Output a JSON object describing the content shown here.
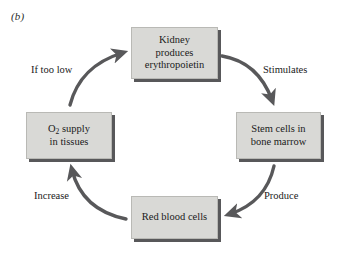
{
  "figure": {
    "panel_label": "(b)",
    "accent_color": "#58585a",
    "box_fill": "#d9d9d6",
    "arrow_color": "#58585a",
    "text_color": "#1a1a1a"
  },
  "nodes": [
    {
      "id": "kidney",
      "text": "Kidney\nproduces\nerythropoietin",
      "position": "top"
    },
    {
      "id": "stem-cells",
      "text": "Stem cells in\nbone marrow",
      "position": "right"
    },
    {
      "id": "red-blood-cells",
      "text": "Red blood cells",
      "position": "bottom"
    },
    {
      "id": "oxygen-supply",
      "text_before_sub": "O",
      "sub": "2",
      "text_after_sub": " supply\nin tissues",
      "position": "left"
    }
  ],
  "edges": [
    {
      "id": "stimulates",
      "label": "Stimulates",
      "from": "kidney",
      "to": "stem-cells"
    },
    {
      "id": "produce",
      "label": "Produce",
      "from": "stem-cells",
      "to": "red-blood-cells"
    },
    {
      "id": "increase",
      "label": "Increase",
      "from": "red-blood-cells",
      "to": "oxygen-supply"
    },
    {
      "id": "if-too-low",
      "label": "If too low",
      "from": "oxygen-supply",
      "to": "kidney"
    }
  ]
}
